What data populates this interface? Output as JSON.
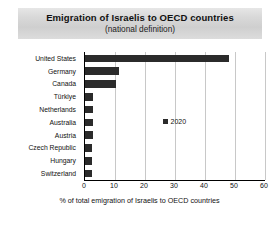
{
  "title": {
    "main": "Emigration of Israelis to OECD countries",
    "sub": "(national definition)"
  },
  "legend": {
    "series_label": "2020",
    "marker": "square-marker"
  },
  "axis": {
    "x_title": "% of total emigration of Israelis to OECD countries",
    "x_ticks": [
      "0",
      "10",
      "20",
      "30",
      "40",
      "50",
      "60"
    ]
  },
  "colors": {
    "bar": "#2b2b2b",
    "grid": "#c8c8c8",
    "axis": "#000000",
    "title_band": "#d9d9d9"
  },
  "chart_data": {
    "type": "bar",
    "orientation": "horizontal",
    "title": "Emigration of Israelis to OECD countries (national definition)",
    "xlabel": "% of total emigration of Israelis to OECD countries",
    "ylabel": "",
    "xlim": [
      0,
      60
    ],
    "xticks": [
      0,
      10,
      20,
      30,
      40,
      50,
      60
    ],
    "grid": true,
    "legend_position": "inside-center",
    "categories": [
      "United States",
      "Germany",
      "Canada",
      "Türkiye",
      "Netherlands",
      "Australia",
      "Austria",
      "Czech Republic",
      "Hungary",
      "Switzerland"
    ],
    "series": [
      {
        "name": "2020",
        "values": [
          48.0,
          11.3,
          10.3,
          2.8,
          2.7,
          2.6,
          2.5,
          2.4,
          2.3,
          2.2
        ]
      }
    ]
  }
}
